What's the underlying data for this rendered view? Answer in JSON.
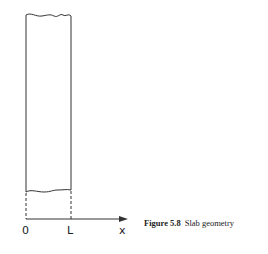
{
  "figure": {
    "axis_labels": {
      "origin": "0",
      "slab_thickness": "L",
      "axis": "x"
    },
    "caption": {
      "number": "Figure 5.8",
      "text": "Slab geometry"
    },
    "colors": {
      "line": "#333333",
      "background": "#ffffff"
    }
  }
}
